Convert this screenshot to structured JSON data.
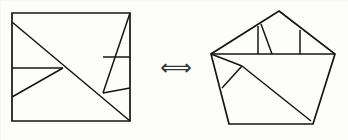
{
  "figure": {
    "caption": "",
    "relation_symbol": "⟺",
    "relation_name": "is-equidecomposable-with",
    "stroke_color": "#141414",
    "background_color": "#fdfdfc",
    "left_shape": {
      "name": "square",
      "label": "",
      "outline": [
        [
          12,
          13
        ],
        [
          130,
          13
        ],
        [
          130,
          121
        ],
        [
          12,
          121
        ]
      ],
      "cuts": [
        {
          "name": "main-diagonal",
          "points": [
            [
              12,
              22
            ],
            [
              130,
              121
            ]
          ]
        },
        {
          "name": "upper-right-slant",
          "points": [
            [
              130,
              13
            ],
            [
              103,
              93
            ]
          ]
        },
        {
          "name": "mid-horizontal",
          "points": [
            [
              12,
              68
            ],
            [
              63,
              68
            ]
          ]
        },
        {
          "name": "lower-left-slant",
          "points": [
            [
              63,
              68
            ],
            [
              12,
              97
            ]
          ]
        },
        {
          "name": "right-horizontal",
          "points": [
            [
              103,
              57
            ],
            [
              130,
              57
            ]
          ]
        },
        {
          "name": "lower-right-slant",
          "points": [
            [
              103,
              93
            ],
            [
              130,
              88
            ]
          ]
        }
      ]
    },
    "right_shape": {
      "name": "pentagon-house",
      "label": "",
      "outline": [
        [
          279,
          11
        ],
        [
          335,
          54
        ],
        [
          313,
          124
        ],
        [
          229,
          124
        ],
        [
          211,
          54
        ]
      ],
      "cuts": [
        {
          "name": "base-horizontal",
          "points": [
            [
              211,
              54
            ],
            [
              335,
              54
            ]
          ]
        },
        {
          "name": "left-roof-edge",
          "points": [
            [
              279,
              11
            ],
            [
              211,
              54
            ]
          ]
        },
        {
          "name": "vertical-left",
          "points": [
            [
              258,
              26
            ],
            [
              258,
              54
            ]
          ]
        },
        {
          "name": "slant-inner",
          "points": [
            [
              261,
              24
            ],
            [
              272,
              54
            ]
          ]
        },
        {
          "name": "vertical-right",
          "points": [
            [
              300,
              30
            ],
            [
              300,
              54
            ]
          ]
        },
        {
          "name": "short-left-slant",
          "points": [
            [
              242,
              66
            ],
            [
              222,
              88
            ]
          ]
        },
        {
          "name": "body-top-slant",
          "points": [
            [
              211,
              54
            ],
            [
              242,
              66
            ]
          ]
        },
        {
          "name": "long-diagonal",
          "points": [
            [
              242,
              66
            ],
            [
              311,
              121
            ]
          ]
        }
      ]
    }
  }
}
